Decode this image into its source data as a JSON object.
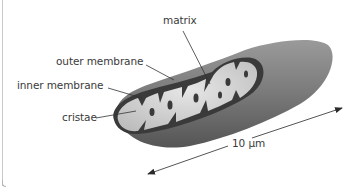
{
  "diagram": {
    "labels": {
      "matrix": "matrix",
      "outer_membrane": "outer membrane",
      "inner_membrane": "inner membrane",
      "cristae": "cristae",
      "scale": "10 μm"
    },
    "colors": {
      "outer_body": "#7a7a7a",
      "inner_membrane": "#3c3c3c",
      "matrix": "#d8d8d8",
      "label_text": "#3a3a3a",
      "leader_line": "#333333"
    }
  }
}
